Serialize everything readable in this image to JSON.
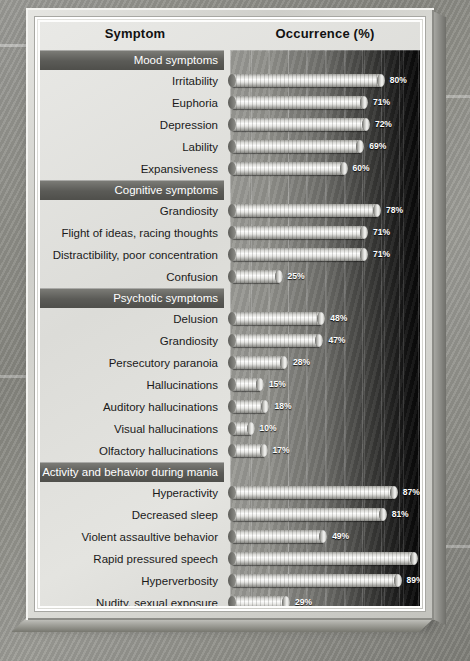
{
  "figure": {
    "header": {
      "col_symptom": "Symptom",
      "col_occurrence": "Occurrence (%)"
    },
    "axis": {
      "ticks": [
        "0",
        "10",
        "20",
        "30",
        "40",
        "50",
        "60",
        "70",
        "80",
        "90",
        "100"
      ]
    }
  },
  "chart_data": {
    "type": "bar",
    "orientation": "horizontal",
    "title": "",
    "xlabel": "Occurrence (%)",
    "ylabel": "Symptom",
    "xlim": [
      0,
      100
    ],
    "xticks": [
      0,
      10,
      20,
      30,
      40,
      50,
      60,
      70,
      80,
      90,
      100
    ],
    "grid": true,
    "legend": "none",
    "value_suffix": "%",
    "sections": [
      {
        "name": "Mood symptoms",
        "categories": [
          "Irritability",
          "Euphoria",
          "Depression",
          "Lability",
          "Expansiveness"
        ],
        "values": [
          80,
          71,
          72,
          69,
          60
        ],
        "labels": [
          "80%",
          "71%",
          "72%",
          "69%",
          "60%"
        ]
      },
      {
        "name": "Cognitive symptoms",
        "categories": [
          "Grandiosity",
          "Flight of ideas, racing thoughts",
          "Distractibility, poor concentration",
          "Confusion"
        ],
        "values": [
          78,
          71,
          71,
          25
        ],
        "labels": [
          "78%",
          "71%",
          "71%",
          "25%"
        ]
      },
      {
        "name": "Psychotic symptoms",
        "categories": [
          "Delusion",
          "Grandiosity",
          "Persecutory paranoia",
          "Hallucinations",
          "Auditory hallucinations",
          "Visual hallucinations",
          "Olfactory hallucinations"
        ],
        "values": [
          48,
          47,
          28,
          15,
          18,
          10,
          17
        ],
        "labels": [
          "48%",
          "47%",
          "28%",
          "15%",
          "18%",
          "10%",
          "17%"
        ]
      },
      {
        "name": "Activity and behavior during mania",
        "categories": [
          "Hyperactivity",
          "Decreased sleep",
          "Violent assaultive behavior",
          "Rapid pressured speech",
          "Hyperverbosity",
          "Nudity, sexual exposure",
          "Hypersexuality",
          "Extravagance",
          "Religiosity"
        ],
        "values": [
          87,
          81,
          49,
          98,
          89,
          29,
          57,
          55,
          39
        ],
        "labels": [
          "87%",
          "81%",
          "49%",
          "98%",
          "89%",
          "29%",
          "57%",
          "55%",
          "39%"
        ]
      }
    ]
  },
  "colors": {
    "section_band": "#5b5b57",
    "panel": "#e4e4e0",
    "bar_light": "#fbfbfa",
    "plot_dark": "#050505"
  }
}
